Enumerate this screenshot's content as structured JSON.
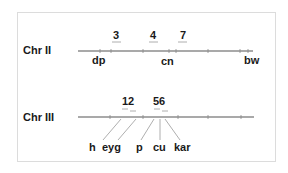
{
  "chromosomes": [
    {
      "name": "Chr II",
      "markers": [
        "3",
        "4",
        "7"
      ],
      "genes": [
        "dp",
        "cn",
        "bw"
      ]
    },
    {
      "name": "Chr III",
      "markers": [
        "12",
        "56"
      ],
      "genes": [
        "h",
        "eyg",
        "p",
        "cu",
        "kar"
      ]
    }
  ],
  "colors": {
    "line": "#555555",
    "text": "#1a1a1a",
    "frame": "#dcdcdc"
  }
}
